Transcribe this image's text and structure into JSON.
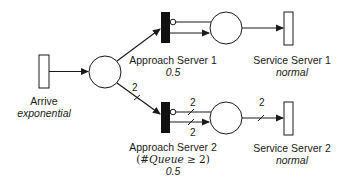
{
  "diagram": {
    "type": "petri-net",
    "transitions": [
      {
        "id": "arrive",
        "name": "Arrive",
        "distribution": "exponential",
        "style": "timed-hollow"
      },
      {
        "id": "approach1",
        "name": "Approach Server 1",
        "guard": "",
        "probability": "0.5",
        "style": "immediate-filled"
      },
      {
        "id": "approach2",
        "name": "Approach Server 2",
        "guard_prefix": "(#",
        "guard_var": "Queue",
        "guard_suffix": " ≥ 2)",
        "probability": "0.5",
        "style": "immediate-filled"
      },
      {
        "id": "service1",
        "name": "Service Server 1",
        "distribution": "normal",
        "style": "timed-hollow"
      },
      {
        "id": "service2",
        "name": "Service Server 2",
        "distribution": "normal",
        "style": "timed-hollow"
      }
    ],
    "places": [
      {
        "id": "queue",
        "name": ""
      },
      {
        "id": "server1",
        "name": ""
      },
      {
        "id": "server2",
        "name": ""
      }
    ],
    "arcs": [
      {
        "from": "arrive",
        "to": "queue",
        "weight": ""
      },
      {
        "from": "queue",
        "to": "approach1",
        "weight": ""
      },
      {
        "from": "queue",
        "to": "approach2",
        "weight": "2"
      },
      {
        "from": "server1",
        "to": "approach1",
        "type": "inhibitor",
        "weight": ""
      },
      {
        "from": "approach1",
        "to": "server1",
        "weight": ""
      },
      {
        "from": "server1",
        "to": "service1",
        "weight": ""
      },
      {
        "from": "server2",
        "to": "approach2",
        "type": "inhibitor",
        "weight": "2"
      },
      {
        "from": "approach2",
        "to": "server2",
        "weight": "2"
      },
      {
        "from": "server2",
        "to": "service2",
        "weight": "2"
      }
    ],
    "weights": {
      "queue_to_approach2": "2",
      "inhibitor_server2": "2",
      "approach2_to_server2": "2",
      "server2_to_service2": "2"
    }
  }
}
